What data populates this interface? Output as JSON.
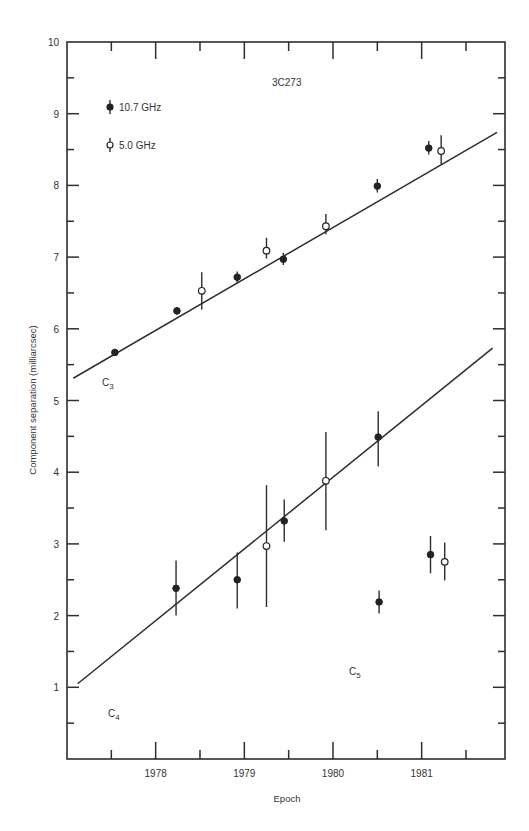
{
  "chart_data": {
    "type": "scatter",
    "title": "3C273",
    "xlabel": "Epoch",
    "ylabel": "Component separation (milliarcsec)",
    "xlim": [
      1977.0,
      1981.94
    ],
    "ylim": [
      0,
      10
    ],
    "x_ticks": [
      1978,
      1979,
      1980,
      1981
    ],
    "x_tick_labels": [
      "1978",
      "1979",
      "1980",
      "1981"
    ],
    "x_minor_ticks": [
      1977.5,
      1978.5,
      1979.5,
      1980.5,
      1981.5
    ],
    "y_ticks": [
      1,
      2,
      3,
      4,
      5,
      6,
      7,
      8,
      9,
      10
    ],
    "y_tick_labels": [
      "1",
      "2",
      "3",
      "4",
      "5",
      "6",
      "7",
      "8",
      "9",
      "10"
    ],
    "grid": false,
    "legend_position": "upper-left",
    "legend": [
      {
        "label": "10.7 GHz",
        "marker": "filled-circle"
      },
      {
        "label": "5.0 GHz",
        "marker": "open-circle"
      }
    ],
    "annotations": [
      {
        "text": "C",
        "sub": "3",
        "x": 1977.45,
        "y": 5.3
      },
      {
        "text": "C",
        "sub": "4",
        "x": 1977.5,
        "y": 1.0
      },
      {
        "text": "C",
        "sub": "5",
        "x": 1980.3,
        "y": 1.75
      },
      {
        "text": "3C273",
        "x": 1979.2,
        "y": 9.4
      }
    ],
    "series": [
      {
        "name": "C3 10.7 GHz",
        "component": "C3",
        "marker": "filled",
        "points": [
          {
            "x": 1977.54,
            "y": 5.67,
            "ylo": 5.62,
            "yhi": 5.72
          },
          {
            "x": 1978.24,
            "y": 6.25,
            "ylo": 6.2,
            "yhi": 6.3
          },
          {
            "x": 1978.92,
            "y": 6.72,
            "ylo": 6.64,
            "yhi": 6.8
          },
          {
            "x": 1979.44,
            "y": 6.97,
            "ylo": 6.89,
            "yhi": 7.06
          },
          {
            "x": 1980.5,
            "y": 7.99,
            "ylo": 7.9,
            "yhi": 8.09
          },
          {
            "x": 1981.08,
            "y": 8.52,
            "ylo": 8.43,
            "yhi": 8.62
          }
        ]
      },
      {
        "name": "C3 5.0 GHz",
        "component": "C3",
        "marker": "open",
        "points": [
          {
            "x": 1978.52,
            "y": 6.53,
            "ylo": 6.27,
            "yhi": 6.79
          },
          {
            "x": 1979.25,
            "y": 7.09,
            "ylo": 6.98,
            "yhi": 7.27
          },
          {
            "x": 1979.92,
            "y": 7.43,
            "ylo": 7.32,
            "yhi": 7.6
          },
          {
            "x": 1981.22,
            "y": 8.48,
            "ylo": 8.3,
            "yhi": 8.7
          }
        ]
      },
      {
        "name": "C4 10.7 GHz",
        "component": "C4",
        "marker": "filled",
        "points": [
          {
            "x": 1978.23,
            "y": 2.38,
            "ylo": 2.0,
            "yhi": 2.77
          },
          {
            "x": 1978.92,
            "y": 2.5,
            "ylo": 2.1,
            "yhi": 2.88
          },
          {
            "x": 1979.45,
            "y": 3.32,
            "ylo": 3.03,
            "yhi": 3.62
          },
          {
            "x": 1980.51,
            "y": 4.49,
            "ylo": 4.08,
            "yhi": 4.85
          }
        ]
      },
      {
        "name": "C4 5.0 GHz",
        "component": "C4",
        "marker": "open",
        "points": [
          {
            "x": 1979.25,
            "y": 2.97,
            "ylo": 2.12,
            "yhi": 3.82
          },
          {
            "x": 1979.92,
            "y": 3.88,
            "ylo": 3.19,
            "yhi": 4.56
          }
        ]
      },
      {
        "name": "C5 10.7 GHz",
        "component": "C5",
        "marker": "filled",
        "points": [
          {
            "x": 1980.52,
            "y": 2.19,
            "ylo": 2.03,
            "yhi": 2.35
          },
          {
            "x": 1981.1,
            "y": 2.85,
            "ylo": 2.59,
            "yhi": 3.11
          }
        ]
      },
      {
        "name": "C5 5.0 GHz",
        "component": "C5",
        "marker": "open",
        "points": [
          {
            "x": 1981.26,
            "y": 2.75,
            "ylo": 2.49,
            "yhi": 3.02
          }
        ]
      }
    ],
    "fit_lines": [
      {
        "name": "C3 fit",
        "x": [
          1977.07,
          1981.85
        ],
        "y": [
          5.31,
          8.74
        ]
      },
      {
        "name": "C4 fit",
        "x": [
          1977.12,
          1981.8
        ],
        "y": [
          1.05,
          5.73
        ]
      }
    ]
  }
}
